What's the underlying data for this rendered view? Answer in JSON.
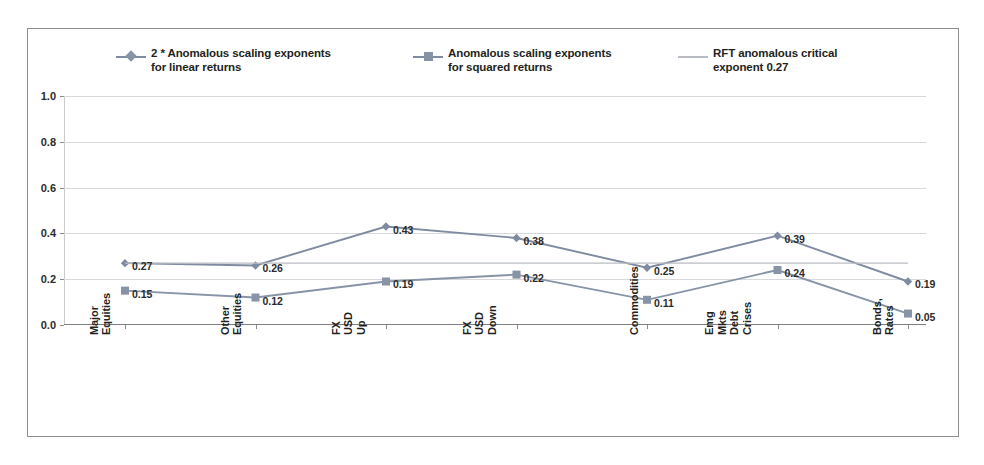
{
  "chart_data": {
    "type": "line",
    "title": "",
    "xlabel": "",
    "ylabel": "",
    "ylim": [
      0.0,
      1.0
    ],
    "yticks": [
      "0.0",
      "0.2",
      "0.4",
      "0.6",
      "0.8",
      "1.0"
    ],
    "ytick_values": [
      0.0,
      0.2,
      0.4,
      0.6,
      0.8,
      1.0
    ],
    "grid": true,
    "legend_position": "top",
    "categories": [
      "Major Equities",
      "Other Equities",
      "FX USD Up",
      "FX USD Down",
      "Commodities",
      "Emg Mkts\nDebt Crises",
      "Bonds, Rates"
    ],
    "series": [
      {
        "name": "2 * Anomalous scaling exponents\nfor linear returns",
        "marker": "diamond",
        "color": "#7f8ba0",
        "values": [
          0.27,
          0.26,
          0.43,
          0.38,
          0.25,
          0.39,
          0.19
        ],
        "labels": [
          "0.27",
          "0.26",
          "0.43",
          "0.38",
          "0.25",
          "0.39",
          "0.19"
        ]
      },
      {
        "name": "Anomalous scaling exponents\nfor squared returns",
        "marker": "square",
        "color": "#8793a6",
        "values": [
          0.15,
          0.12,
          0.19,
          0.22,
          0.11,
          0.24,
          0.05
        ],
        "labels": [
          "0.15",
          "0.12",
          "0.19",
          "0.22",
          "0.11",
          "0.24",
          "0.05"
        ]
      },
      {
        "name": "RFT anomalous critical\nexponent 0.27",
        "marker": "none",
        "color": "#b9bcc2",
        "constant": 0.27,
        "values": [
          0.27,
          0.27,
          0.27,
          0.27,
          0.27,
          0.27,
          0.27
        ],
        "labels": []
      }
    ]
  },
  "legend": {
    "items": [
      {
        "label": "2 * Anomalous scaling exponents\nfor linear returns",
        "marker": "diamond",
        "color": "#7f8ba0"
      },
      {
        "label": "Anomalous scaling exponents\nfor squared returns",
        "marker": "square",
        "color": "#8793a6"
      },
      {
        "label": "RFT anomalous critical\nexponent 0.27",
        "marker": "none",
        "color": "#b9bcc2"
      }
    ]
  },
  "colors": {
    "series_linear": "#7f8ba0",
    "series_squared": "#8793a6",
    "rft_line": "#b9bcc2",
    "gridline": "#d7d9dc",
    "axis": "#7d7f83",
    "text": "#231f20",
    "frame_border": "#8e8e90",
    "background": "#ffffff"
  }
}
